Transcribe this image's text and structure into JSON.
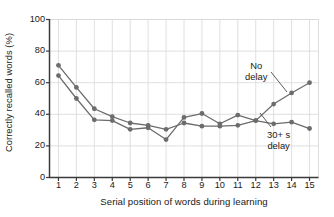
{
  "chart_data": {
    "type": "line",
    "title": "",
    "xlabel": "Serial position of words during learning",
    "ylabel": "Correctly recalled words (%)",
    "x": [
      1,
      2,
      3,
      4,
      5,
      6,
      7,
      8,
      9,
      10,
      11,
      12,
      13,
      14,
      15
    ],
    "xticklabels": [
      "1",
      "2",
      "3",
      "4",
      "5",
      "6",
      "7",
      "8",
      "9",
      "10",
      "11",
      "12",
      "13",
      "14",
      "15"
    ],
    "yticklabels": [
      "0",
      "20",
      "40",
      "60",
      "80",
      "100"
    ],
    "yticks": [
      0,
      20,
      40,
      60,
      80,
      100
    ],
    "xlim": [
      0.5,
      15.5
    ],
    "ylim": [
      0,
      100
    ],
    "grid": true,
    "legend_position": "inline-annotations",
    "series": [
      {
        "name": "No delay",
        "color": "#6c6c6c",
        "marker": "circle",
        "values": [
          71,
          57,
          43.5,
          38.5,
          34.5,
          33,
          30.5,
          34.5,
          32.5,
          32.5,
          33,
          36,
          46.5,
          53.5,
          60
        ]
      },
      {
        "name": "30+ s delay",
        "color": "#6c6c6c",
        "marker": "circle",
        "values": [
          64.5,
          50,
          36.5,
          36,
          30.5,
          31.5,
          24,
          38,
          40.5,
          34,
          39.5,
          36,
          34,
          35,
          31
        ]
      }
    ],
    "annotations": [
      {
        "id": "no-delay",
        "line1": "No",
        "line2": "delay"
      },
      {
        "id": "delay",
        "line1": "30+ s",
        "line2": "delay"
      }
    ]
  },
  "colors": {
    "axis": "#3b3b3b",
    "grid": "#d8d8d8",
    "data": "#6c6c6c",
    "text": "#1a1a1a",
    "background": "#ffffff"
  }
}
